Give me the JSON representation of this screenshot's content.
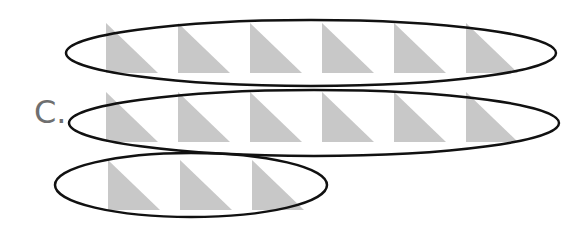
{
  "label": "C.",
  "colors": {
    "triangle_fill": "#c8c8c8",
    "ellipse_stroke": "#111111",
    "label_color": "#6f6f6f"
  },
  "triangle": {
    "width": 52,
    "height": 50
  },
  "groups": [
    {
      "name": "group-1",
      "count": 6,
      "triangle_top": 23,
      "triangle_x": [
        106,
        178,
        250,
        322,
        394,
        466
      ],
      "ellipse": {
        "cx": 311,
        "cy": 53,
        "rx": 245,
        "ry": 33
      }
    },
    {
      "name": "group-2",
      "count": 6,
      "triangle_top": 92,
      "triangle_x": [
        106,
        178,
        250,
        322,
        394,
        466
      ],
      "ellipse": {
        "cx": 314,
        "cy": 123,
        "rx": 245,
        "ry": 33
      }
    },
    {
      "name": "group-3",
      "count": 3,
      "triangle_top": 160,
      "triangle_x": [
        108,
        180,
        252
      ],
      "ellipse": {
        "cx": 191,
        "cy": 185,
        "rx": 136,
        "ry": 32
      }
    }
  ]
}
